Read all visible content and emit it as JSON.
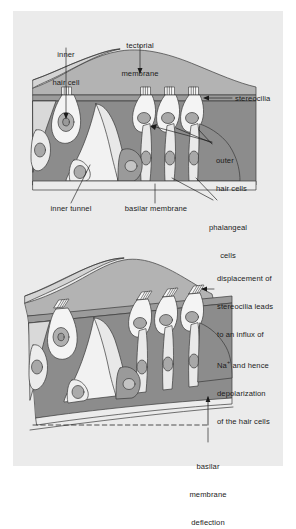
{
  "figure": {
    "background_color": "#ebebeb",
    "page_color": "#ffffff"
  },
  "palette": {
    "membrane_fill": "#b3b3b3",
    "supporting_cell_fill": "#8c8c8c",
    "hair_cell_fill": "#f2f2f2",
    "nucleus_fill": "#9a9a9a",
    "outline": "#3a3a3a",
    "text": "#1b1b1b"
  },
  "top_panel": {
    "labels": [
      {
        "id": "inner-hair-cell",
        "text": "inner\nhair cell",
        "align": "center"
      },
      {
        "id": "tectorial-membrane",
        "text": "tectorial\nmembrane",
        "align": "center"
      },
      {
        "id": "stereocilia",
        "text": "stereocilia",
        "align": "left"
      },
      {
        "id": "outer-hair-cells",
        "text": "outer\nhair cells",
        "align": "left"
      },
      {
        "id": "inner-tunnel",
        "text": "inner tunnel",
        "align": "center"
      },
      {
        "id": "basilar-membrane",
        "text": "basilar membrane",
        "align": "center"
      },
      {
        "id": "phalangeal-cells",
        "text": "phalangeal\ncells",
        "align": "center"
      }
    ],
    "label_text": {
      "inner_hair_cell_line1": "inner",
      "inner_hair_cell_line2": "hair cell",
      "tectorial_membrane_line1": "tectorial",
      "tectorial_membrane_line2": "membrane",
      "stereocilia": "stereocilia",
      "outer_hair_cells_line1": "outer",
      "outer_hair_cells_line2": "hair cells",
      "inner_tunnel": "inner tunnel",
      "basilar_membrane": "basilar membrane",
      "phalangeal_cells_line1": "phalangeal",
      "phalangeal_cells_line2": "cells"
    }
  },
  "bottom_panel": {
    "annotation": {
      "line1": "displacement of",
      "line2": "stereocilia leads",
      "line3": "to an influx of",
      "line4_pre": "Na",
      "line4_sup": "+",
      "line4_post": " and hence",
      "line5": "depolarization",
      "line6": "of the hair cells"
    },
    "deflection_label": {
      "line1": "basilar",
      "line2": "membrane",
      "line3": "deflection"
    }
  }
}
